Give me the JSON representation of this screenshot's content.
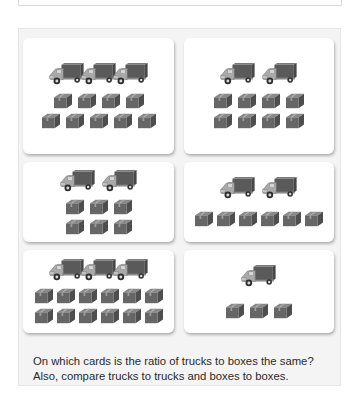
{
  "cards": [
    {
      "id": "card-1",
      "trucks": 3,
      "box_rows": [
        4,
        5
      ],
      "boxes": 9
    },
    {
      "id": "card-2",
      "trucks": 2,
      "box_rows": [
        4,
        4
      ],
      "boxes": 8
    },
    {
      "id": "card-3",
      "trucks": 2,
      "box_rows": [
        3,
        3
      ],
      "boxes": 6
    },
    {
      "id": "card-4",
      "trucks": 2,
      "box_rows": [
        6
      ],
      "boxes": 6
    },
    {
      "id": "card-5",
      "trucks": 3,
      "box_rows": [
        6,
        6
      ],
      "boxes": 12
    },
    {
      "id": "card-6",
      "trucks": 1,
      "box_rows": [
        3
      ],
      "boxes": 3
    }
  ],
  "icons": {
    "truck": "delivery-truck-icon",
    "box": "package-box-icon"
  },
  "colors": {
    "panel_bg": "#f4f4f4",
    "card_bg": "#ffffff",
    "truck_cargo": "#5e5e5e",
    "truck_cab": "#a8a8a8",
    "box": "#666666"
  },
  "question": {
    "line1": "On which cards is the ratio of trucks to boxes the same?",
    "line2": "Also, compare trucks to trucks and boxes to boxes."
  }
}
